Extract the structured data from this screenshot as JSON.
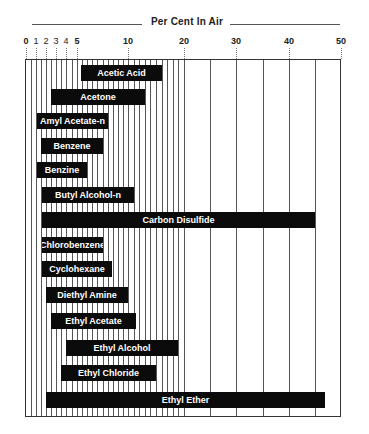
{
  "chart_data": {
    "type": "bar",
    "orientation": "horizontal-range",
    "title": "Per Cent In Air",
    "xlabel": "Per Cent In Air",
    "ylabel": "",
    "xlim": [
      0,
      50
    ],
    "grid": true,
    "legend": null,
    "x_tick_labels": [
      "0",
      "1",
      "2",
      "3",
      "4",
      "5",
      "10",
      "20",
      "30",
      "40",
      "50"
    ],
    "x_ticks": [
      {
        "value": 0,
        "px": 26,
        "bold": true
      },
      {
        "value": 1,
        "px": 36,
        "bold": false
      },
      {
        "value": 2,
        "px": 46,
        "bold": false
      },
      {
        "value": 3,
        "px": 56,
        "bold": false
      },
      {
        "value": 4,
        "px": 66,
        "bold": false
      },
      {
        "value": 5,
        "px": 77,
        "bold": true
      },
      {
        "value": 10,
        "px": 128,
        "bold": true
      },
      {
        "value": 20,
        "px": 184,
        "bold": true
      },
      {
        "value": 30,
        "px": 236,
        "bold": true
      },
      {
        "value": 40,
        "px": 289,
        "bold": true
      },
      {
        "value": 50,
        "px": 341,
        "bold": true
      }
    ],
    "categories": [
      "Acetic Acid",
      "Acetone",
      "Amyl Acetate-n",
      "Benzene",
      "Benzine",
      "Butyl Alcohol-n",
      "Carbon Disulfide",
      "Chlorobenzene",
      "Cyclohexane",
      "Diethyl Amine",
      "Ethyl Acetate",
      "Ethyl Alcohol",
      "Ethyl Chloride",
      "Ethyl Ether"
    ],
    "series": [
      {
        "name": "Flammable range (% in air)",
        "ranges": [
          {
            "label": "Acetic Acid",
            "low": 5.4,
            "high": 16.0
          },
          {
            "label": "Acetone",
            "low": 2.5,
            "high": 13.0
          },
          {
            "label": "Amyl Acetate-n",
            "low": 1.1,
            "high": 8.0
          },
          {
            "label": "Benzene",
            "low": 1.5,
            "high": 7.5
          },
          {
            "label": "Benzine",
            "low": 1.1,
            "high": 6.0
          },
          {
            "label": "Butyl Alcohol-n",
            "low": 1.6,
            "high": 11.0
          },
          {
            "label": "Carbon Disulfide",
            "low": 1.6,
            "high": 45.0
          },
          {
            "label": "Chlorobenzene",
            "low": 1.6,
            "high": 7.5
          },
          {
            "label": "Cyclohexane",
            "low": 1.6,
            "high": 8.4
          },
          {
            "label": "Diethyl Amine",
            "low": 2.0,
            "high": 10.0
          },
          {
            "label": "Ethyl Acetate",
            "low": 2.5,
            "high": 11.5
          },
          {
            "label": "Ethyl Alcohol",
            "low": 4.0,
            "high": 19.0
          },
          {
            "label": "Ethyl Chloride",
            "low": 3.5,
            "high": 15.0
          },
          {
            "label": "Ethyl Ether",
            "low": 2.0,
            "high": 47.0
          }
        ]
      }
    ],
    "bar_rows_top_px": [
      65,
      89,
      113,
      138,
      162,
      187,
      212,
      237,
      261,
      287,
      313,
      340,
      365,
      392
    ],
    "bar_height_px": 16,
    "bar_color": "#0b0b0b",
    "bar_text_color": "#ffffff",
    "grid_color": "#555555"
  }
}
